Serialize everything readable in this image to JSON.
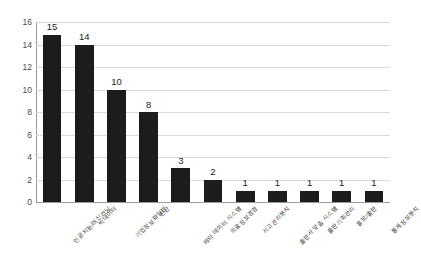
{
  "chart_data": {
    "type": "bar",
    "title": "",
    "xlabel": "",
    "ylabel": "",
    "ylim": [
      0,
      16
    ],
    "ytick_step": 2,
    "yticks": [
      16,
      14,
      12,
      10,
      8,
      6,
      4,
      2,
      0
    ],
    "grid": true,
    "legend": false,
    "bar_color": "#1c1c1c",
    "categories": [
      "인공지능/머신러닝",
      "빅데이터",
      "기업정보화일반",
      "전산",
      "메타 데이터 시스템",
      "의료정보경영",
      "서고관리분석",
      "출판사 맞춤 시스템",
      "출판기획관리",
      "홍보/출판",
      "통계정보분석"
    ],
    "values": [
      15,
      14,
      10,
      8,
      3,
      2,
      1,
      1,
      1,
      1,
      1
    ],
    "data_labels": [
      "15",
      "14",
      "10",
      "8",
      "3",
      "2",
      "1",
      "1",
      "1",
      "1",
      "1"
    ]
  }
}
